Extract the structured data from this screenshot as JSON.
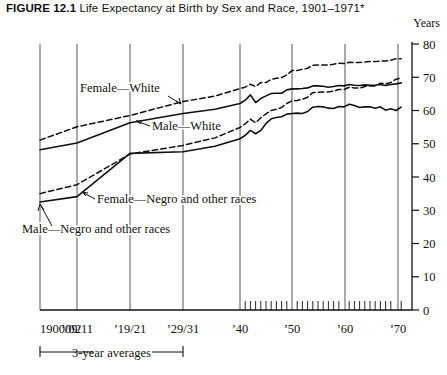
{
  "figure": {
    "number": "FIGURE 12.1",
    "title": "Life Expectancy at Birth by Sex and Race, 1901–1971*",
    "axis_unit_label": "Years"
  },
  "annotations": {
    "female_white": "Female—White",
    "male_white": "Male—White",
    "female_negro": "Female—Negro and other races",
    "male_negro": "Male—Negro and other races",
    "bracket": "3-year averages"
  },
  "colors": {
    "ink": "#111111",
    "grid": "#444444",
    "background": "#ffffff"
  },
  "chart_data": {
    "type": "line",
    "title": "Life Expectancy at Birth by Sex and Race, 1901–1971*",
    "xlabel": "",
    "ylabel": "Years",
    "ylim": [
      0,
      80
    ],
    "yticks": [
      0,
      10,
      20,
      30,
      40,
      50,
      60,
      70,
      80
    ],
    "grid": true,
    "legend": "inline-annotations",
    "xtick_labels": [
      "1900/02",
      "’09/11",
      "’19/21",
      "’29/31",
      "’40",
      "’50",
      "’60",
      "’70"
    ],
    "x_note": "Left portion uses 3-year averages at 1900/02, '09/11, '19/21, '29/31; annual values from 1940 to 1971",
    "minor_tick_years": [
      1940,
      1941,
      1942,
      1943,
      1944,
      1945,
      1946,
      1947,
      1948,
      1949,
      1950,
      1951,
      1952,
      1953,
      1954,
      1955,
      1956,
      1957,
      1958,
      1959,
      1960,
      1961,
      1962,
      1963,
      1964,
      1965,
      1966,
      1967,
      1968,
      1969,
      1970,
      1971
    ],
    "series": [
      {
        "name": "Female—White",
        "style": "dashed",
        "averages": [
          {
            "period": "1900/02",
            "value": 51.1
          },
          {
            "period": "’09/11",
            "value": 55.1
          },
          {
            "period": "’19/21",
            "value": 58.5
          },
          {
            "period": "’29/31",
            "value": 62.7
          }
        ],
        "annual": [
          {
            "year": 1940,
            "value": 66.6
          },
          {
            "year": 1941,
            "value": 67.0
          },
          {
            "year": 1942,
            "value": 67.9
          },
          {
            "year": 1943,
            "value": 67.2
          },
          {
            "year": 1944,
            "value": 68.4
          },
          {
            "year": 1945,
            "value": 68.4
          },
          {
            "year": 1946,
            "value": 69.4
          },
          {
            "year": 1947,
            "value": 69.7
          },
          {
            "year": 1948,
            "value": 69.9
          },
          {
            "year": 1949,
            "value": 70.7
          },
          {
            "year": 1950,
            "value": 72.0
          },
          {
            "year": 1951,
            "value": 72.0
          },
          {
            "year": 1952,
            "value": 72.4
          },
          {
            "year": 1953,
            "value": 72.7
          },
          {
            "year": 1954,
            "value": 73.6
          },
          {
            "year": 1955,
            "value": 73.7
          },
          {
            "year": 1956,
            "value": 73.7
          },
          {
            "year": 1957,
            "value": 73.7
          },
          {
            "year": 1958,
            "value": 73.9
          },
          {
            "year": 1959,
            "value": 74.2
          },
          {
            "year": 1960,
            "value": 74.1
          },
          {
            "year": 1961,
            "value": 74.5
          },
          {
            "year": 1962,
            "value": 74.4
          },
          {
            "year": 1963,
            "value": 74.4
          },
          {
            "year": 1964,
            "value": 74.6
          },
          {
            "year": 1965,
            "value": 74.7
          },
          {
            "year": 1966,
            "value": 74.7
          },
          {
            "year": 1967,
            "value": 74.9
          },
          {
            "year": 1968,
            "value": 74.9
          },
          {
            "year": 1969,
            "value": 75.1
          },
          {
            "year": 1970,
            "value": 75.6
          },
          {
            "year": 1971,
            "value": 75.6
          }
        ]
      },
      {
        "name": "Male—White",
        "style": "solid",
        "averages": [
          {
            "period": "1900/02",
            "value": 48.2
          },
          {
            "period": "’09/11",
            "value": 50.2
          },
          {
            "period": "’19/21",
            "value": 56.3
          },
          {
            "period": "’29/31",
            "value": 59.1
          }
        ],
        "annual": [
          {
            "year": 1940,
            "value": 62.1
          },
          {
            "year": 1941,
            "value": 63.1
          },
          {
            "year": 1942,
            "value": 64.7
          },
          {
            "year": 1943,
            "value": 62.4
          },
          {
            "year": 1944,
            "value": 63.6
          },
          {
            "year": 1945,
            "value": 64.4
          },
          {
            "year": 1946,
            "value": 65.1
          },
          {
            "year": 1947,
            "value": 65.2
          },
          {
            "year": 1948,
            "value": 65.2
          },
          {
            "year": 1949,
            "value": 66.2
          },
          {
            "year": 1950,
            "value": 66.5
          },
          {
            "year": 1951,
            "value": 66.5
          },
          {
            "year": 1952,
            "value": 66.6
          },
          {
            "year": 1953,
            "value": 66.8
          },
          {
            "year": 1954,
            "value": 67.4
          },
          {
            "year": 1955,
            "value": 67.4
          },
          {
            "year": 1956,
            "value": 67.3
          },
          {
            "year": 1957,
            "value": 67.0
          },
          {
            "year": 1958,
            "value": 67.2
          },
          {
            "year": 1959,
            "value": 67.5
          },
          {
            "year": 1960,
            "value": 67.4
          },
          {
            "year": 1961,
            "value": 67.8
          },
          {
            "year": 1962,
            "value": 67.6
          },
          {
            "year": 1963,
            "value": 67.5
          },
          {
            "year": 1964,
            "value": 67.7
          },
          {
            "year": 1965,
            "value": 67.6
          },
          {
            "year": 1966,
            "value": 67.6
          },
          {
            "year": 1967,
            "value": 67.8
          },
          {
            "year": 1968,
            "value": 67.5
          },
          {
            "year": 1969,
            "value": 67.8
          },
          {
            "year": 1970,
            "value": 68.0
          },
          {
            "year": 1971,
            "value": 68.3
          }
        ]
      },
      {
        "name": "Female—Negro and other races",
        "style": "dashed",
        "averages": [
          {
            "period": "1900/02",
            "value": 35.0
          },
          {
            "period": "’09/11",
            "value": 37.7
          },
          {
            "period": "’19/21",
            "value": 46.9
          },
          {
            "period": "’29/31",
            "value": 49.5
          }
        ],
        "annual": [
          {
            "year": 1940,
            "value": 54.9
          },
          {
            "year": 1941,
            "value": 56.0
          },
          {
            "year": 1942,
            "value": 57.4
          },
          {
            "year": 1943,
            "value": 56.3
          },
          {
            "year": 1944,
            "value": 57.8
          },
          {
            "year": 1945,
            "value": 59.0
          },
          {
            "year": 1946,
            "value": 60.0
          },
          {
            "year": 1947,
            "value": 60.4
          },
          {
            "year": 1948,
            "value": 60.9
          },
          {
            "year": 1949,
            "value": 62.1
          },
          {
            "year": 1950,
            "value": 62.9
          },
          {
            "year": 1951,
            "value": 63.0
          },
          {
            "year": 1952,
            "value": 63.4
          },
          {
            "year": 1953,
            "value": 64.0
          },
          {
            "year": 1954,
            "value": 65.4
          },
          {
            "year": 1955,
            "value": 65.5
          },
          {
            "year": 1956,
            "value": 65.6
          },
          {
            "year": 1957,
            "value": 65.6
          },
          {
            "year": 1958,
            "value": 65.8
          },
          {
            "year": 1959,
            "value": 66.3
          },
          {
            "year": 1960,
            "value": 66.3
          },
          {
            "year": 1961,
            "value": 67.0
          },
          {
            "year": 1962,
            "value": 66.8
          },
          {
            "year": 1963,
            "value": 66.7
          },
          {
            "year": 1964,
            "value": 67.2
          },
          {
            "year": 1965,
            "value": 67.4
          },
          {
            "year": 1966,
            "value": 67.4
          },
          {
            "year": 1967,
            "value": 68.2
          },
          {
            "year": 1968,
            "value": 68.0
          },
          {
            "year": 1969,
            "value": 68.4
          },
          {
            "year": 1970,
            "value": 69.4
          },
          {
            "year": 1971,
            "value": 69.8
          }
        ]
      },
      {
        "name": "Male—Negro and other races",
        "style": "solid",
        "averages": [
          {
            "period": "1900/02",
            "value": 32.5
          },
          {
            "period": "’09/11",
            "value": 34.1
          },
          {
            "period": "’19/21",
            "value": 47.1
          },
          {
            "period": "’29/31",
            "value": 47.6
          }
        ],
        "annual": [
          {
            "year": 1940,
            "value": 51.5
          },
          {
            "year": 1941,
            "value": 52.5
          },
          {
            "year": 1942,
            "value": 54.0
          },
          {
            "year": 1943,
            "value": 53.0
          },
          {
            "year": 1944,
            "value": 54.0
          },
          {
            "year": 1945,
            "value": 56.1
          },
          {
            "year": 1946,
            "value": 57.5
          },
          {
            "year": 1947,
            "value": 57.9
          },
          {
            "year": 1948,
            "value": 58.1
          },
          {
            "year": 1949,
            "value": 58.9
          },
          {
            "year": 1950,
            "value": 59.1
          },
          {
            "year": 1951,
            "value": 59.2
          },
          {
            "year": 1952,
            "value": 59.1
          },
          {
            "year": 1953,
            "value": 59.7
          },
          {
            "year": 1954,
            "value": 61.0
          },
          {
            "year": 1955,
            "value": 61.2
          },
          {
            "year": 1956,
            "value": 61.1
          },
          {
            "year": 1957,
            "value": 60.7
          },
          {
            "year": 1958,
            "value": 60.6
          },
          {
            "year": 1959,
            "value": 61.2
          },
          {
            "year": 1960,
            "value": 61.1
          },
          {
            "year": 1961,
            "value": 61.9
          },
          {
            "year": 1962,
            "value": 61.5
          },
          {
            "year": 1963,
            "value": 60.9
          },
          {
            "year": 1964,
            "value": 61.1
          },
          {
            "year": 1965,
            "value": 61.1
          },
          {
            "year": 1966,
            "value": 60.7
          },
          {
            "year": 1967,
            "value": 61.1
          },
          {
            "year": 1968,
            "value": 60.1
          },
          {
            "year": 1969,
            "value": 60.5
          },
          {
            "year": 1970,
            "value": 60.0
          },
          {
            "year": 1971,
            "value": 61.0
          }
        ]
      }
    ]
  }
}
